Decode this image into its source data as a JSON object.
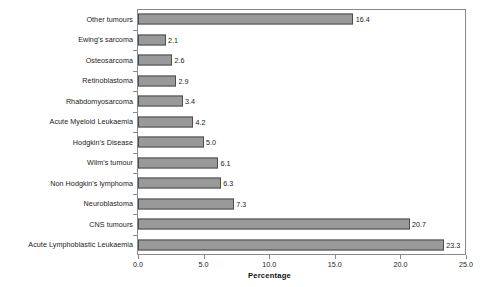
{
  "chart_data": {
    "type": "bar",
    "orientation": "horizontal",
    "title": "",
    "xlabel": "Percentage",
    "ylabel": "",
    "xlim": [
      0.0,
      25.0
    ],
    "xticks": [
      "0.0",
      "5.0",
      "10.0",
      "15.0",
      "20.0",
      "25.0"
    ],
    "xtick_values": [
      0.0,
      5.0,
      10.0,
      15.0,
      20.0,
      25.0
    ],
    "grid": false,
    "legend": null,
    "categories": [
      "Other tumours",
      "Ewing's sarcoma",
      "Osteosarcoma",
      "Retinoblastoma",
      "Rhabdomyosarcoma",
      "Acute Myeloid Leukaemia",
      "Hodgkin's Disease",
      "Wilm's tumour",
      "Non Hodgkin's lymphoma",
      "Neuroblastoma",
      "CNS tumours",
      "Acute Lymphoblastic Leukaemia"
    ],
    "values": [
      16.4,
      2.1,
      2.6,
      2.9,
      3.4,
      4.2,
      5.0,
      6.1,
      6.3,
      7.3,
      20.7,
      23.3
    ],
    "value_labels": [
      "16.4",
      "2.1",
      "2.6",
      "2.9",
      "3.4",
      "4.2",
      "5.0",
      "6.1",
      "6.3",
      "7.3",
      "20.7",
      "23.3"
    ],
    "bar_fill_color": "#999999",
    "bar_border_color": "#4d4d4d",
    "axis_color": "#8a8a8a",
    "background_color": "#ffffff"
  }
}
